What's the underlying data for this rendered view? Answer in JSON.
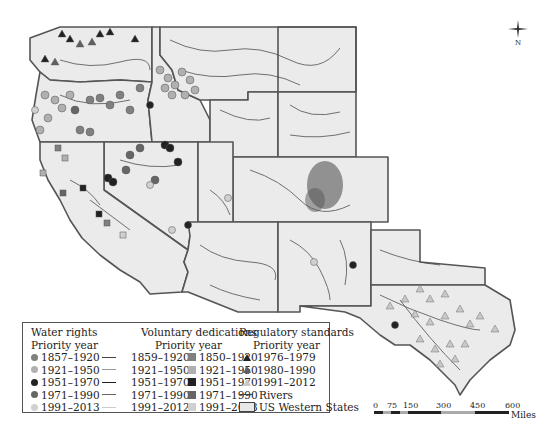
{
  "map": {
    "title": "US Western States water rights, voluntary dedications and regulatory standards",
    "colors": {
      "state_fill": "#ebebeb",
      "state_border": "#555555",
      "river": "#4a4a4a",
      "wr_1857_1920": "#808080",
      "wr_1921_1950": "#b0b0b0",
      "wr_1951_1970": "#222222",
      "wr_1971_1990": "#666666",
      "wr_1991_2013": "#d0d0d0",
      "rs_1976_1979": "#222222",
      "rs_1980_1990": "#606060",
      "rs_1991_2012": "#c8c8c8"
    }
  },
  "compass": {
    "label": "N"
  },
  "legend": {
    "water_rights": {
      "title": "Water rights",
      "subtitle": "Priority year",
      "items": [
        "1857–1920",
        "1921–1950",
        "1951–1970",
        "1971–1990",
        "1991–2013"
      ]
    },
    "water_rights_lines": {
      "items": [
        "1859–1920",
        "1921–1950",
        "1951–1970",
        "1971–1990",
        "1991–2012"
      ]
    },
    "voluntary_dedications": {
      "title": "Voluntary dedications",
      "subtitle": "Priority year",
      "items": [
        "1850–1920",
        "1921–1950",
        "1951–1970",
        "1971–1990",
        "1991–2013"
      ]
    },
    "regulatory_standards": {
      "title": "Regulatory standards",
      "subtitle": "Priority year",
      "items": [
        "1976–1979",
        "1980–1990",
        "1991–2012"
      ],
      "rivers_label": "Rivers",
      "states_label": "US Western States"
    }
  },
  "scale_bar": {
    "ticks": [
      "0",
      "75",
      "150",
      "300",
      "450",
      "600"
    ],
    "unit": "Miles"
  }
}
